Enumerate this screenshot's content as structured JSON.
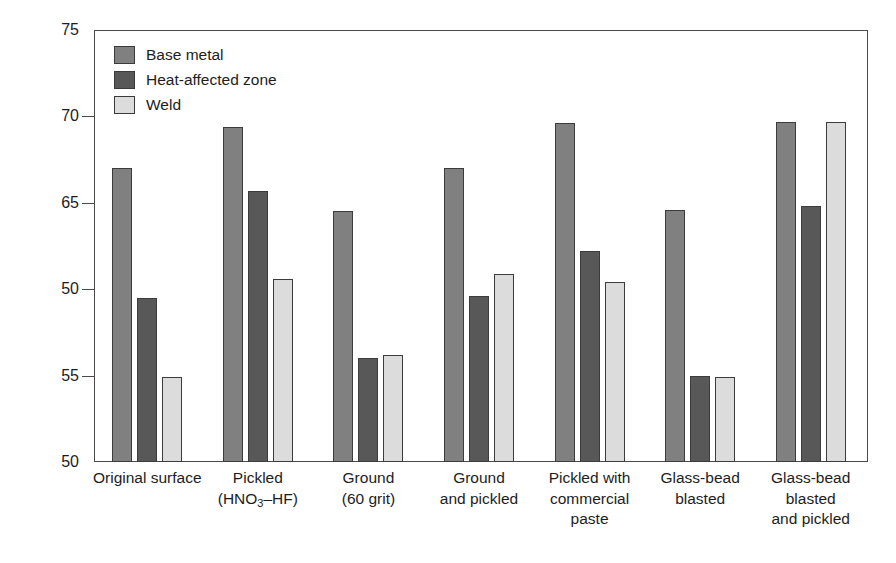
{
  "chart_data": {
    "type": "bar",
    "title": "",
    "xlabel": "",
    "ylabel": "Critical pitting temperature (°C)",
    "ylim": [
      50,
      75
    ],
    "ytick_labels": [
      "75",
      "70",
      "65",
      "50",
      "55",
      "50"
    ],
    "ytick_positions": [
      75,
      70,
      65,
      60,
      55,
      50
    ],
    "grid": false,
    "legend_position": "top-left",
    "categories": [
      "Original surface",
      "Pickled (HNO3–HF)",
      "Ground (60 grit)",
      "Ground and pickled",
      "Pickled with commercial paste",
      "Glass-bead blasted",
      "Glass-bead blasted and pickled"
    ],
    "series": [
      {
        "name": "Base metal",
        "color": "#808080",
        "values": [
          67.0,
          69.4,
          64.5,
          67.0,
          69.6,
          64.6,
          69.7
        ]
      },
      {
        "name": "Heat-affected zone",
        "color": "#585858",
        "values": [
          59.5,
          65.7,
          56.0,
          59.6,
          62.2,
          55.0,
          64.8
        ]
      },
      {
        "name": "Weld",
        "color": "#dcdcdc",
        "values": [
          54.9,
          60.6,
          56.2,
          60.9,
          60.4,
          54.9,
          69.7
        ]
      }
    ]
  },
  "legend": {
    "items": [
      {
        "label": "Base metal",
        "color": "#808080"
      },
      {
        "label": "Heat-affected zone",
        "color": "#585858"
      },
      {
        "label": "Weld",
        "color": "#dcdcdc"
      }
    ]
  },
  "axes": {
    "y_title": "Critical pitting temperature (°C)",
    "y_ticks": [
      "75",
      "70",
      "65",
      "50",
      "55",
      "50"
    ]
  },
  "x_categories": [
    {
      "lines": [
        "Original surface"
      ]
    },
    {
      "lines": [
        "Pickled",
        "(HNO|3|–HF)"
      ]
    },
    {
      "lines": [
        "Ground",
        "(60 grit)"
      ]
    },
    {
      "lines": [
        "Ground",
        "and pickled"
      ]
    },
    {
      "lines": [
        "Pickled with",
        "commercial",
        "paste"
      ]
    },
    {
      "lines": [
        "Glass-bead",
        "blasted"
      ]
    },
    {
      "lines": [
        "Glass-bead",
        "blasted",
        "and pickled"
      ]
    }
  ],
  "colors": {
    "base_metal": "#808080",
    "heat_affected_zone": "#585858",
    "weld": "#dcdcdc",
    "axis": "#4a4a4a",
    "text": "#1d1d1d",
    "background": "#ffffff"
  }
}
